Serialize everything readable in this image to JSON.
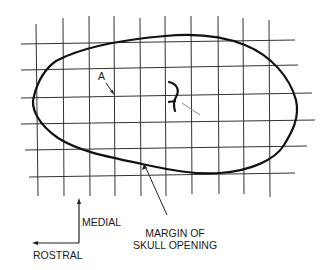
{
  "diagram": {
    "colors": {
      "background": "#ffffff",
      "grid": "#333333",
      "outline": "#111111",
      "pointer": "#888888",
      "text": "#1a1a1a"
    },
    "grid": {
      "vertical_x": [
        36,
        63,
        89,
        114,
        140,
        165,
        191,
        218,
        243,
        269
      ],
      "horizontal_y": [
        44,
        70,
        98,
        124,
        150,
        177
      ]
    },
    "labels": {
      "point_a": "A",
      "medial": "MEDIAL",
      "rostral": "ROSTRAL",
      "margin_line1": "MARGIN OF",
      "margin_line2": "SKULL OPENING"
    },
    "icons": {
      "medial_arrow": "arrow-up-icon",
      "rostral_arrow": "arrow-left-icon"
    }
  }
}
